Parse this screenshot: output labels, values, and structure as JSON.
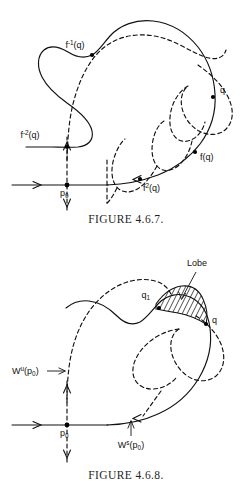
{
  "page": {
    "background_color": "#ffffff",
    "ink_color": "#111111"
  },
  "figures": [
    {
      "id": "figure-1",
      "caption": "FIGURE 4.6.7.",
      "labels": {
        "f_inv_q": "f-1(q)",
        "f_inv_q_base": "f",
        "f_inv_q_exp": "-1",
        "f_inv_q_arg": "(q)",
        "f_inv2_q_base": "f",
        "f_inv2_q_exp": "-2",
        "f_inv2_q_arg": "(q)",
        "q": "q",
        "f_q": "f(q)",
        "f2_q_base": "f",
        "f2_q_exp": "2",
        "f2_q_arg": "(q)",
        "p0_base": "p",
        "p0_sub": "0"
      }
    },
    {
      "id": "figure-2",
      "caption": "FIGURE 4.6.8.",
      "labels": {
        "lobe": "Lobe",
        "q1_base": "q",
        "q1_sub": "1",
        "q": "q",
        "wu_base": "W",
        "wu_exp": "u",
        "wu_arg_open": "(p",
        "wu_arg_sub": "0",
        "wu_arg_close": ")",
        "ws_base": "W",
        "ws_exp": "s",
        "ws_arg_open": "(p",
        "ws_arg_sub": "0",
        "ws_arg_close": ")",
        "p0_base": "p",
        "p0_sub": "0"
      }
    }
  ]
}
